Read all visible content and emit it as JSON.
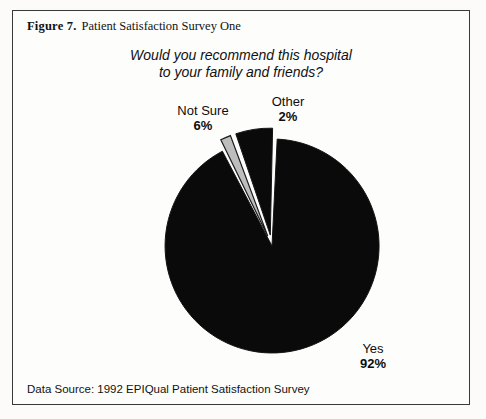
{
  "figure": {
    "label": "Figure 7.",
    "title": "Patient Satisfaction Survey One",
    "footer": "Data Source: 1992 EPIQual Patient Satisfaction Survey"
  },
  "question": {
    "line1": "Would you recommend this hospital",
    "line2": "to your family and friends?"
  },
  "labels": {
    "yes_name": "Yes",
    "yes_pct": "92%",
    "not_sure_name": "Not Sure",
    "not_sure_pct": "6%",
    "other_name": "Other",
    "other_pct": "2%"
  },
  "colors": {
    "yes": "#0a0a0a",
    "not_sure": "#0a0a0a",
    "other": "#bdbdbd",
    "slice_outline": "#1a1a1a",
    "frame": "#3a3a3a",
    "background": "#fdfdfc",
    "text": "#121212"
  },
  "chart_data": {
    "type": "pie",
    "title": "Would you recommend this hospital to your family and friends?",
    "categories": [
      "Yes",
      "Not Sure",
      "Other"
    ],
    "values": [
      92,
      6,
      2
    ],
    "value_labels": [
      "92%",
      "6%",
      "2%"
    ],
    "units": "percent",
    "colors": [
      "#0a0a0a",
      "#0a0a0a",
      "#bdbdbd"
    ],
    "exploded": [
      "Not Sure",
      "Other"
    ],
    "start_angle_deg": -10,
    "direction": "clockwise",
    "legend": "none",
    "labels_position": "outside",
    "grid": false,
    "source": "1992 EPIQual Patient Satisfaction Survey"
  }
}
